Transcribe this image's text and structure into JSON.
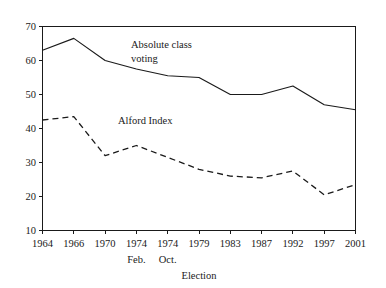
{
  "chart_data": {
    "type": "line",
    "title": "",
    "xlabel": "Election",
    "ylabel": "",
    "ylim": [
      10,
      70
    ],
    "ytick_labels": [
      "10",
      "20",
      "30",
      "40",
      "50",
      "60",
      "70"
    ],
    "ytick_values": [
      10,
      20,
      30,
      40,
      50,
      60,
      70
    ],
    "grid": false,
    "legend_position": "inline-annotations",
    "categories": [
      "1964",
      "1966",
      "1970",
      "1974",
      "1974",
      "1979",
      "1983",
      "1987",
      "1992",
      "1997",
      "2001"
    ],
    "category_sublabels": [
      "",
      "",
      "",
      "Feb.",
      "Oct.",
      "",
      "",
      "",
      "",
      "",
      ""
    ],
    "series": [
      {
        "name": "Absolute class voting",
        "style": "solid",
        "values": [
          63,
          66.5,
          60,
          57.5,
          55.5,
          55,
          50,
          50,
          52.5,
          47,
          45.5
        ]
      },
      {
        "name": "Alford Index",
        "style": "dashed",
        "values": [
          42.5,
          43.5,
          32,
          35,
          31.5,
          28,
          26,
          25.5,
          27.5,
          20.5,
          23.5
        ]
      }
    ],
    "annotations": [
      {
        "text": "Absolute class\nvoting",
        "x_px": 131,
        "y_px": 38
      },
      {
        "text": "Alford Index",
        "x_px": 118,
        "y_px": 114
      }
    ],
    "colors": {
      "line": "#1a1a1a",
      "axis": "#1a1a1a",
      "background": "#ffffff"
    }
  }
}
